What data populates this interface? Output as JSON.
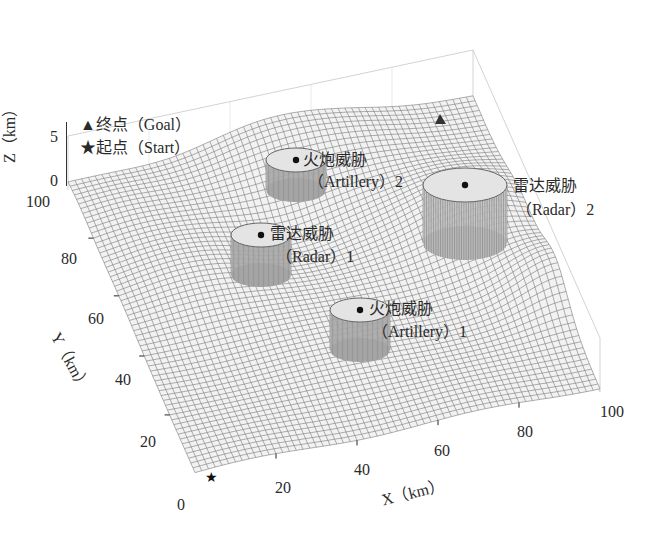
{
  "chart_data": {
    "type": "surface3d",
    "title": "",
    "xlabel": "X（km）",
    "ylabel": "Y（km）",
    "zlabel": "Z（km）",
    "xlim": [
      0,
      100
    ],
    "ylim": [
      0,
      100
    ],
    "zlim": [
      0,
      5
    ],
    "x_ticks": [
      "0",
      "20",
      "40",
      "60",
      "80",
      "100"
    ],
    "y_ticks": [
      "0",
      "20",
      "40",
      "60",
      "80",
      "100"
    ],
    "z_ticks": [
      "0",
      "5"
    ],
    "grid": true,
    "legend": [
      {
        "marker": "▲",
        "label": "终点（Goal）"
      },
      {
        "marker": "★",
        "label": "起点（Start）"
      }
    ],
    "start": {
      "x": 5,
      "y": 5,
      "label": "Start"
    },
    "goal": {
      "x": 95,
      "y": 95,
      "label": "Goal"
    },
    "threats": [
      {
        "type": "Radar",
        "name": "雷达威胁",
        "sub": "（Radar）1",
        "x": 30,
        "y": 70,
        "radius": 8
      },
      {
        "type": "Radar",
        "name": "雷达威胁",
        "sub": "（Radar）2",
        "x": 85,
        "y": 65,
        "radius": 11
      },
      {
        "type": "Artillery",
        "name": "火炮威胁",
        "sub": "（Artillery）1",
        "x": 60,
        "y": 45,
        "radius": 8
      },
      {
        "type": "Artillery",
        "name": "火炮威胁",
        "sub": "（Artillery）2",
        "x": 55,
        "y": 85,
        "radius": 7
      }
    ]
  },
  "labels": {
    "legend_goal": "▲终点（Goal）",
    "legend_start": "★起点（Start）",
    "z_axis": "Z（km）",
    "y_axis": "Y（km）",
    "x_axis": "X（km）",
    "radar1_a": "雷达威胁",
    "radar1_b": "（Radar）1",
    "radar2_a": "雷达威胁",
    "radar2_b": "（Radar）2",
    "art1_a": "火炮威胁",
    "art1_b": "（Artillery）1",
    "art2_a": "火炮威胁",
    "art2_b": "（Artillery）2"
  },
  "ticks": {
    "z5": "5",
    "z0": "0",
    "y100": "100",
    "y80": "80",
    "y60": "60",
    "y40": "40",
    "y20": "20",
    "x0": "0",
    "x20": "20",
    "x40": "40",
    "x60": "60",
    "x80": "80",
    "x100": "100"
  }
}
